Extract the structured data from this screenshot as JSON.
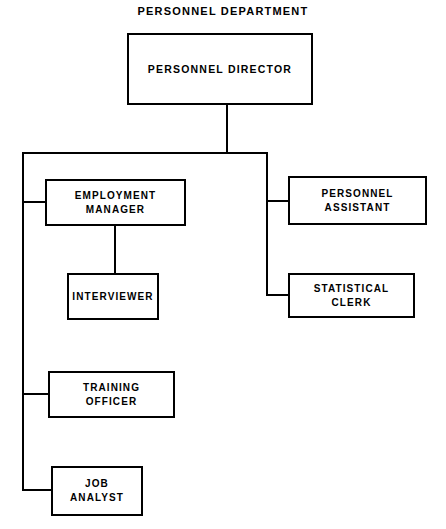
{
  "chart": {
    "title": "PERSONNEL DEPARTMENT",
    "type": "organization-chart",
    "colors": {
      "line": "#000000",
      "box_fill": "#ffffff",
      "text": "#000000",
      "background": "#ffffff"
    },
    "nodes": {
      "director": {
        "label": "PERSONNEL DIRECTOR",
        "level": 0,
        "x": 127,
        "y": 33,
        "width": 186,
        "height": 72
      },
      "employment_manager": {
        "label": "EMPLOYMENT\nMANAGER",
        "level": 1,
        "branch": "left",
        "x": 45,
        "y": 179,
        "width": 141,
        "height": 47
      },
      "interviewer": {
        "label": "INTERVIEWER",
        "level": 2,
        "branch": "left",
        "x": 67,
        "y": 273,
        "width": 92,
        "height": 47
      },
      "training_officer": {
        "label": "TRAINING\nOFFICER",
        "level": 1,
        "branch": "left",
        "x": 48,
        "y": 371,
        "width": 127,
        "height": 47
      },
      "job_analyst": {
        "label": "JOB\nANALYST",
        "level": 1,
        "branch": "left",
        "x": 51,
        "y": 466,
        "width": 92,
        "height": 50
      },
      "personnel_assistant": {
        "label": "PERSONNEL\nASSISTANT",
        "level": 1,
        "branch": "right",
        "x": 288,
        "y": 176,
        "width": 139,
        "height": 49
      },
      "statistical_clerk": {
        "label": "STATISTICAL\nCLERK",
        "level": 1,
        "branch": "right",
        "x": 288,
        "y": 273,
        "width": 127,
        "height": 45
      }
    },
    "edges": [
      {
        "from": "director",
        "to": "distribution-bar",
        "name": "director-drop"
      },
      {
        "from": "distribution-bar",
        "to": "employment_manager",
        "name": "left-trunk-to-employment-manager"
      },
      {
        "from": "employment_manager",
        "to": "interviewer",
        "name": "employment-manager-to-interviewer"
      },
      {
        "from": "distribution-bar",
        "to": "training_officer",
        "name": "left-trunk-to-training-officer"
      },
      {
        "from": "distribution-bar",
        "to": "job_analyst",
        "name": "left-trunk-to-job-analyst"
      },
      {
        "from": "distribution-bar",
        "to": "personnel_assistant",
        "name": "right-trunk-to-personnel-assistant"
      },
      {
        "from": "distribution-bar",
        "to": "statistical_clerk",
        "name": "right-trunk-to-statistical-clerk"
      }
    ]
  }
}
